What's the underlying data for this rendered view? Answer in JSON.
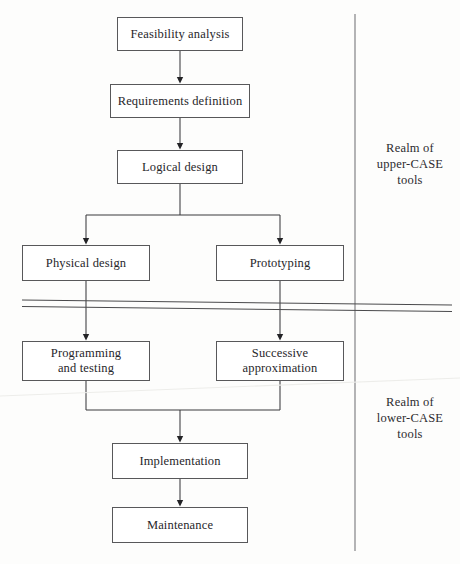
{
  "diagram": {
    "type": "flowchart",
    "canvas": {
      "width": 460,
      "height": 564
    },
    "colors": {
      "background": "#fdfdfc",
      "box_stroke": "#58585a",
      "connector": "#3a3a3d",
      "text": "#27262a",
      "divider": "#4a4a4c"
    },
    "nodes": [
      {
        "id": "feasibility",
        "label": "Feasibility analysis",
        "x": 117,
        "y": 17,
        "w": 126,
        "h": 34
      },
      {
        "id": "requirements",
        "label": "Requirements definition",
        "x": 110,
        "y": 84,
        "w": 140,
        "h": 34
      },
      {
        "id": "logical",
        "label": "Logical design",
        "x": 117,
        "y": 150,
        "w": 126,
        "h": 34
      },
      {
        "id": "physical",
        "label": "Physical design",
        "x": 22,
        "y": 245,
        "w": 128,
        "h": 36
      },
      {
        "id": "prototyping",
        "label": "Prototyping",
        "x": 216,
        "y": 245,
        "w": 128,
        "h": 36
      },
      {
        "id": "programming",
        "label": "Programming\nand testing",
        "x": 22,
        "y": 341,
        "w": 128,
        "h": 40
      },
      {
        "id": "successive",
        "label": "Successive\napproximation",
        "x": 216,
        "y": 341,
        "w": 128,
        "h": 40
      },
      {
        "id": "implementation",
        "label": "Implementation",
        "x": 112,
        "y": 443,
        "w": 136,
        "h": 36
      },
      {
        "id": "maintenance",
        "label": "Maintenance",
        "x": 112,
        "y": 507,
        "w": 136,
        "h": 36
      }
    ],
    "realm_labels": [
      {
        "id": "upper",
        "label": "Realm of\nupper-CASE\ntools",
        "x": 366,
        "y": 140
      },
      {
        "id": "lower",
        "label": "Realm of\nlower-CASE\ntools",
        "x": 366,
        "y": 394
      }
    ],
    "divider": {
      "vertical": {
        "x": 355,
        "y1": 14,
        "y2": 551
      },
      "horizontal_pair": [
        {
          "x1": 22,
          "y1": 300,
          "x2": 452,
          "y2": 305
        },
        {
          "x1": 22,
          "y1": 306,
          "x2": 452,
          "y2": 311
        }
      ]
    },
    "connectors": [
      {
        "from": "feasibility",
        "to": "requirements",
        "kind": "straight-down"
      },
      {
        "from": "requirements",
        "to": "logical",
        "kind": "straight-down"
      },
      {
        "from": "logical",
        "to": "physical",
        "kind": "split-left"
      },
      {
        "from": "logical",
        "to": "prototyping",
        "kind": "split-right"
      },
      {
        "from": "physical",
        "to": "programming",
        "kind": "straight-down"
      },
      {
        "from": "prototyping",
        "to": "successive",
        "kind": "straight-down"
      },
      {
        "from": "programming",
        "to": "implementation",
        "kind": "merge-left"
      },
      {
        "from": "successive",
        "to": "implementation",
        "kind": "merge-right"
      },
      {
        "from": "implementation",
        "to": "maintenance",
        "kind": "straight-down"
      }
    ]
  }
}
